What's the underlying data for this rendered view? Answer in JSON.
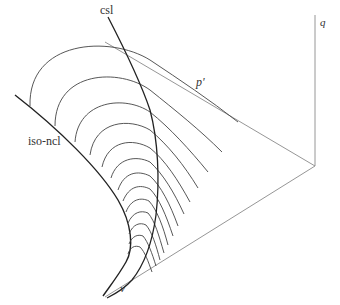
{
  "diagram": {
    "labels": {
      "csl": "csl",
      "iso_ncl": "iso-ncl",
      "p_prime": "p'",
      "q": "q",
      "v": "v"
    },
    "axes": [
      "p'",
      "q",
      "v"
    ],
    "arc_count": 13,
    "colors": {
      "background": "#ffffff",
      "line": "#222222",
      "axis": "#8a8a8a"
    }
  }
}
